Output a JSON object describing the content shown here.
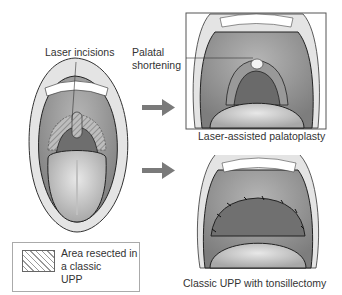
{
  "labels": {
    "laser_incisions": "Laser incisions",
    "palatal_shortening_line1": "Palatal",
    "palatal_shortening_line2": "shortening",
    "lap_caption": "Laser-assisted palatoplasty",
    "upp_caption": "Classic UPP with tonsillectomy"
  },
  "legend": {
    "text": "Area resected in\na classic\nUPP",
    "swatch": "diagonal-hatch"
  },
  "colors": {
    "arrow": "#7a7a7a",
    "mouth_interior": "#8d8d8d",
    "tongue": "#cfcfcf",
    "lips": "#e6e6e6",
    "outline": "#222222"
  }
}
